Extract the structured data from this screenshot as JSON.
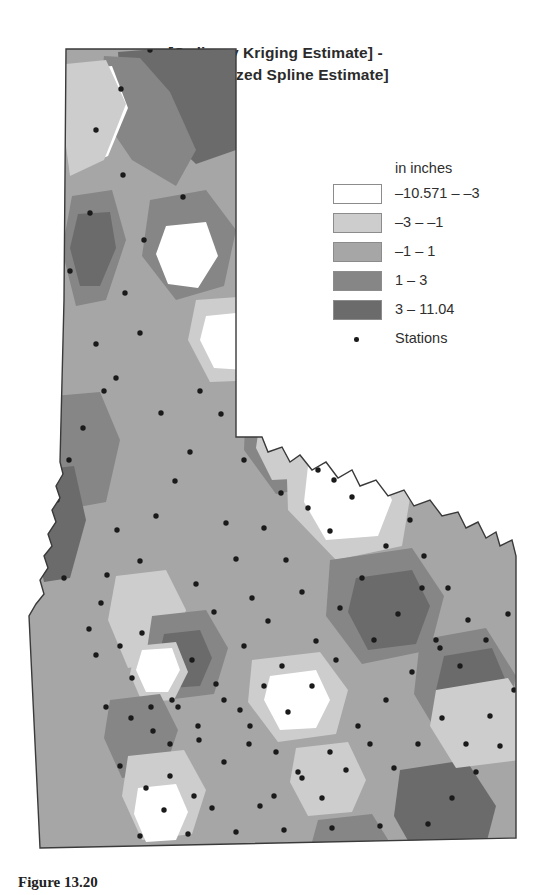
{
  "figure": {
    "title_line1": "[Ordinary Kriging Estimate] -",
    "title_line2": "[Regularized Spline Estimate]",
    "caption": "Figure 13.20"
  },
  "legend": {
    "header": "in inches",
    "classes": [
      {
        "label": "–10.571 – –3",
        "color": "#ffffff"
      },
      {
        "label": "–3 – –1",
        "color": "#cdcdcd"
      },
      {
        "label": "–1 – 1",
        "color": "#a6a6a6"
      },
      {
        "label": "1 – 3",
        "color": "#868686"
      },
      {
        "label": "3 – 11.04",
        "color": "#6b6b6b"
      }
    ],
    "stations_label": "Stations",
    "station_marker_color": "#1a1a1a"
  },
  "chart_data": {
    "type": "heatmap",
    "title": "[Ordinary Kriging Estimate] - [Regularized Spline Estimate]",
    "xlabel": "",
    "ylabel": "",
    "units": "inches",
    "region": "Idaho",
    "value_range": [
      -10.571,
      11.04
    ],
    "class_breaks": [
      -10.571,
      -3,
      -1,
      1,
      3,
      11.04
    ],
    "class_labels": [
      "–10.571 – –3",
      "–3 – –1",
      "–1 – 1",
      "1 – 3",
      "3 – 11.04"
    ],
    "class_colors": [
      "#ffffff",
      "#cdcdcd",
      "#a6a6a6",
      "#868686",
      "#6b6b6b"
    ],
    "legend_position": "right-top",
    "grid": false,
    "overlay_points_label": "Stations",
    "background_class_index": 2,
    "regions": [
      {
        "class": 4,
        "points": "118,52 168,48 236,50 236,150 196,164 150,120 120,86"
      },
      {
        "class": 3,
        "points": "104,56 140,58 170,92 196,150 176,186 132,160 98,110"
      },
      {
        "class": 0,
        "points": "72,70 112,66 128,108 108,156 80,168 68,120"
      },
      {
        "class": 1,
        "points": "66,64 106,60 126,104 104,160 70,176 62,116"
      },
      {
        "class": 3,
        "points": "150,200 206,190 236,230 224,286 176,300 142,256"
      },
      {
        "class": 0,
        "points": "166,226 206,222 218,256 198,288 168,284 156,254"
      },
      {
        "class": 3,
        "points": "72,196 112,190 126,240 106,300 76,306 62,250"
      },
      {
        "class": 4,
        "points": "78,214 110,212 116,248 100,286 80,286 70,248"
      },
      {
        "class": 1,
        "points": "196,300 252,296 276,336 260,380 210,382 188,340"
      },
      {
        "class": 0,
        "points": "206,316 246,312 262,344 246,370 214,368 200,340"
      },
      {
        "class": 3,
        "points": "246,402 312,396 342,436 330,484 276,494 244,450"
      },
      {
        "class": 1,
        "points": "260,420 310,414 326,448 312,478 272,480 256,448"
      },
      {
        "class": 3,
        "points": "54,396 100,392 120,440 106,502 62,510 44,450"
      },
      {
        "class": 4,
        "points": "40,470 74,466 86,520 70,578 44,582 32,522"
      },
      {
        "class": 1,
        "points": "286,450 376,436 412,486 402,546 336,560 288,510"
      },
      {
        "class": 0,
        "points": "308,466 370,458 392,500 378,536 326,540 304,502"
      },
      {
        "class": 3,
        "points": "330,560 412,548 444,596 430,650 362,664 326,616"
      },
      {
        "class": 4,
        "points": "356,578 412,570 430,606 416,644 368,650 348,612"
      },
      {
        "class": 1,
        "points": "116,576 166,570 186,610 172,660 128,668 108,620"
      },
      {
        "class": 3,
        "points": "152,616 206,610 228,648 214,694 166,700 146,656"
      },
      {
        "class": 4,
        "points": "164,634 200,630 212,658 200,686 170,688 158,660"
      },
      {
        "class": 1,
        "points": "136,646 176,642 188,672 174,700 142,702 130,674"
      },
      {
        "class": 0,
        "points": "142,650 172,648 180,670 168,692 146,692 136,670"
      },
      {
        "class": 3,
        "points": "420,640 486,628 516,676 504,732 444,744 414,694"
      },
      {
        "class": 4,
        "points": "444,656 492,648 508,686 494,724 452,730 436,690"
      },
      {
        "class": 1,
        "points": "252,660 320,652 348,690 336,734 278,742 248,702"
      },
      {
        "class": 0,
        "points": "270,676 316,670 330,700 316,728 280,730 264,700"
      },
      {
        "class": 1,
        "points": "296,748 348,742 366,780 352,812 308,816 290,782"
      },
      {
        "class": 3,
        "points": "110,700 160,694 178,730 164,772 122,778 104,738"
      },
      {
        "class": 1,
        "points": "128,756 184,750 206,790 192,834 142,840 122,796"
      },
      {
        "class": 0,
        "points": "138,788 176,784 188,812 176,840 146,842 134,814"
      },
      {
        "class": 4,
        "points": "400,770 466,760 496,806 484,852 420,862 394,816"
      },
      {
        "class": 1,
        "points": "436,690 508,678 532,716 520,760 456,768 430,726"
      },
      {
        "class": 3,
        "points": "318,820 372,814 392,846 378,864 330,866 312,842"
      }
    ],
    "stations": [
      [
        150,
        50
      ],
      [
        96,
        130
      ],
      [
        121,
        89
      ],
      [
        123,
        175
      ],
      [
        183,
        197
      ],
      [
        144,
        240
      ],
      [
        90,
        213
      ],
      [
        70,
        271
      ],
      [
        125,
        293
      ],
      [
        140,
        333
      ],
      [
        96,
        344
      ],
      [
        116,
        378
      ],
      [
        83,
        428
      ],
      [
        104,
        391
      ],
      [
        161,
        413
      ],
      [
        69,
        460
      ],
      [
        57,
        500
      ],
      [
        44,
        548
      ],
      [
        64,
        578
      ],
      [
        101,
        603
      ],
      [
        89,
        629
      ],
      [
        96,
        655
      ],
      [
        120,
        646
      ],
      [
        142,
        633
      ],
      [
        132,
        678
      ],
      [
        151,
        707
      ],
      [
        170,
        744
      ],
      [
        200,
        391
      ],
      [
        221,
        414
      ],
      [
        263,
        387
      ],
      [
        273,
        443
      ],
      [
        244,
        460
      ],
      [
        190,
        452
      ],
      [
        175,
        481
      ],
      [
        156,
        516
      ],
      [
        140,
        561
      ],
      [
        117,
        530
      ],
      [
        107,
        575
      ],
      [
        226,
        523
      ],
      [
        236,
        559
      ],
      [
        252,
        598
      ],
      [
        214,
        612
      ],
      [
        196,
        584
      ],
      [
        286,
        404
      ],
      [
        300,
        437
      ],
      [
        318,
        470
      ],
      [
        281,
        493
      ],
      [
        264,
        528
      ],
      [
        340,
        412
      ],
      [
        356,
        441
      ],
      [
        374,
        468
      ],
      [
        352,
        497
      ],
      [
        330,
        531
      ],
      [
        286,
        560
      ],
      [
        302,
        592
      ],
      [
        268,
        621
      ],
      [
        244,
        646
      ],
      [
        282,
        666
      ],
      [
        316,
        641
      ],
      [
        340,
        608
      ],
      [
        362,
        578
      ],
      [
        386,
        546
      ],
      [
        410,
        520
      ],
      [
        424,
        556
      ],
      [
        448,
        588
      ],
      [
        468,
        620
      ],
      [
        440,
        648
      ],
      [
        412,
        672
      ],
      [
        386,
        700
      ],
      [
        358,
        726
      ],
      [
        330,
        752
      ],
      [
        302,
        778
      ],
      [
        276,
        752
      ],
      [
        250,
        726
      ],
      [
        224,
        700
      ],
      [
        198,
        726
      ],
      [
        172,
        700
      ],
      [
        106,
        707
      ],
      [
        131,
        718
      ],
      [
        153,
        731
      ],
      [
        178,
        707
      ],
      [
        199,
        740
      ],
      [
        224,
        762
      ],
      [
        249,
        744
      ],
      [
        274,
        796
      ],
      [
        298,
        772
      ],
      [
        322,
        798
      ],
      [
        346,
        770
      ],
      [
        370,
        744
      ],
      [
        394,
        768
      ],
      [
        418,
        744
      ],
      [
        442,
        718
      ],
      [
        466,
        744
      ],
      [
        490,
        716
      ],
      [
        514,
        690
      ],
      [
        500,
        746
      ],
      [
        476,
        772
      ],
      [
        452,
        798
      ],
      [
        428,
        824
      ],
      [
        404,
        850
      ],
      [
        380,
        826
      ],
      [
        356,
        852
      ],
      [
        332,
        828
      ],
      [
        308,
        854
      ],
      [
        284,
        830
      ],
      [
        260,
        806
      ],
      [
        236,
        832
      ],
      [
        212,
        808
      ],
      [
        188,
        834
      ],
      [
        164,
        810
      ],
      [
        140,
        836
      ],
      [
        120,
        766
      ],
      [
        146,
        788
      ],
      [
        170,
        776
      ],
      [
        194,
        796
      ],
      [
        436,
        640
      ],
      [
        460,
        666
      ],
      [
        486,
        640
      ],
      [
        508,
        614
      ],
      [
        374,
        640
      ],
      [
        398,
        614
      ],
      [
        422,
        588
      ],
      [
        308,
        508
      ],
      [
        334,
        480
      ],
      [
        360,
        452
      ],
      [
        192,
        660
      ],
      [
        216,
        684
      ],
      [
        240,
        710
      ],
      [
        264,
        686
      ],
      [
        288,
        712
      ],
      [
        312,
        686
      ],
      [
        336,
        660
      ]
    ]
  }
}
